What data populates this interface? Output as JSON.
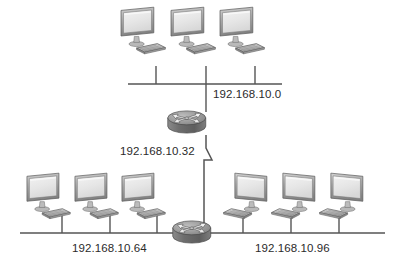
{
  "diagram": {
    "type": "network-topology",
    "background_color": "#ffffff",
    "segments": [
      {
        "id": "top",
        "network_label": "192.168.10.0",
        "router": "top-router",
        "host_count": 3,
        "keyboard_side": "right"
      },
      {
        "id": "bottom-left",
        "network_label": "192.168.10.64",
        "router": "bottom-router",
        "host_count": 3,
        "keyboard_side": "right"
      },
      {
        "id": "bottom-right",
        "network_label": "192.168.10.96",
        "router": "bottom-router",
        "host_count": 3,
        "keyboard_side": "left"
      }
    ],
    "links": [
      {
        "id": "router-to-router",
        "network_label": "192.168.10.32",
        "from": "top-router",
        "to": "bottom-router",
        "style": "zigzag-serial-link"
      }
    ],
    "labels": {
      "net_top": "192.168.10.0",
      "net_link": "192.168.10.32",
      "net_bottom_left": "192.168.10.64",
      "net_bottom_right": "192.168.10.96"
    },
    "devices": {
      "top_router_name": "router",
      "bottom_router_name": "router",
      "host_name": "computer-workstation"
    },
    "colors": {
      "line": "#555555",
      "text": "#2b2b2b",
      "monitor_bezel": "#8c8c8c",
      "monitor_bezel_light": "#cfcfcf",
      "screen": "#e9e9e9",
      "keyboard": "#bdbdbd",
      "router_body": "#6e6e6e",
      "router_top": "#9a9a9a",
      "outline": "#4a4a4a"
    }
  }
}
